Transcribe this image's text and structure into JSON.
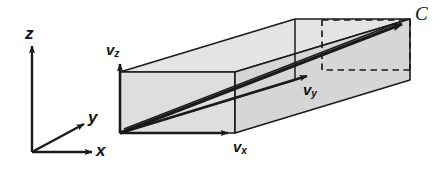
{
  "figure": {
    "background_color": "#ffffff",
    "stroke_color": "#1a1a1a",
    "face_fill_light": "#e6e6e6",
    "face_fill_mid": "#dcdcdc",
    "face_fill_dark": "#d2d2d2"
  },
  "axes": {
    "z": {
      "label": "z",
      "subscript": ""
    },
    "y": {
      "label": "y",
      "subscript": ""
    },
    "x": {
      "label": "x",
      "subscript": ""
    },
    "origin_label": ""
  },
  "components": [
    {
      "name": "v-z",
      "label": "v",
      "subscript": "z"
    },
    {
      "name": "v-y",
      "label": "v",
      "subscript": "y"
    },
    {
      "name": "v-x",
      "label": "v",
      "subscript": "x"
    }
  ],
  "points": [
    {
      "name": "point-c",
      "label": "C"
    }
  ]
}
